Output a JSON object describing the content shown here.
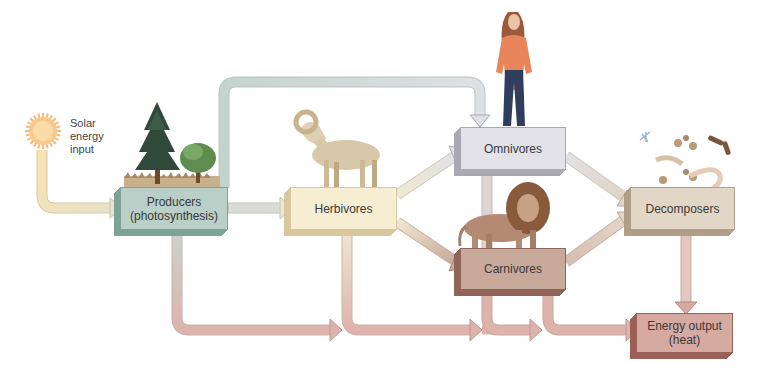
{
  "diagram": {
    "title": "",
    "solar": {
      "label": "Solar\nenergy\ninput",
      "icon": "sun-icon"
    },
    "nodes": [
      {
        "id": "producers",
        "label": "Producers\n(photosynthesis)",
        "color": "#b9cfc7",
        "shade": "#7fa296",
        "illustration": "trees-icon"
      },
      {
        "id": "herbivores",
        "label": "Herbivores",
        "color": "#f6edd2",
        "shade": "#d9c89e",
        "illustration": "ram-icon"
      },
      {
        "id": "omnivores",
        "label": "Omnivores",
        "color": "#e2e2e8",
        "shade": "#a9a9b3",
        "illustration": "human-icon"
      },
      {
        "id": "carnivores",
        "label": "Carnivores",
        "color": "#c9a999",
        "shade": "#8e6558",
        "illustration": "lion-icon"
      },
      {
        "id": "decomposers",
        "label": "Decomposers",
        "color": "#e2d6c6",
        "shade": "#b09e88",
        "illustration": "microbes-icon"
      },
      {
        "id": "energy_output",
        "label": "Energy output\n(heat)",
        "color": "#d6a9a1",
        "shade": "#9a5f57",
        "illustration": ""
      }
    ],
    "edges": [
      {
        "from": "solar",
        "to": "producers"
      },
      {
        "from": "producers",
        "to": "herbivores"
      },
      {
        "from": "producers",
        "to": "omnivores"
      },
      {
        "from": "herbivores",
        "to": "omnivores"
      },
      {
        "from": "herbivores",
        "to": "carnivores"
      },
      {
        "from": "omnivores",
        "to": "carnivores"
      },
      {
        "from": "omnivores",
        "to": "decomposers"
      },
      {
        "from": "carnivores",
        "to": "decomposers"
      },
      {
        "from": "producers",
        "to": "energy_output"
      },
      {
        "from": "herbivores",
        "to": "energy_output"
      },
      {
        "from": "carnivores",
        "to": "energy_output"
      },
      {
        "from": "decomposers",
        "to": "energy_output"
      }
    ]
  }
}
